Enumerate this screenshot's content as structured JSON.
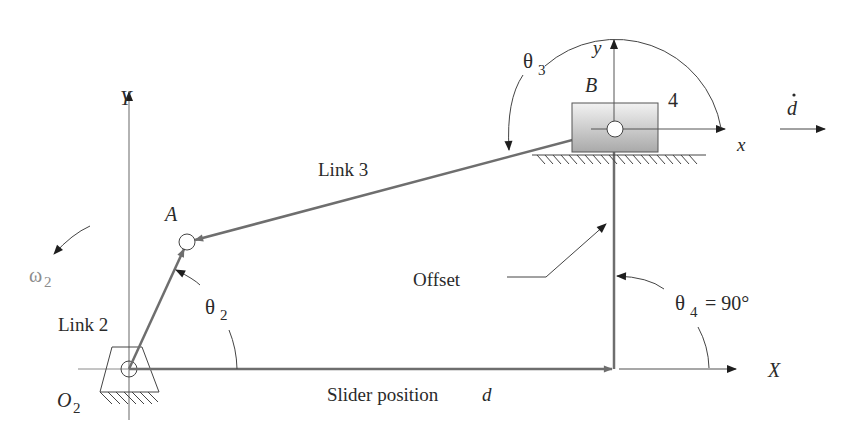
{
  "diagram": {
    "colors": {
      "link": "#6e6e6e",
      "axis": "#8a8a8a",
      "arrowhead": "#1e1e1e",
      "text": "#2a2a2a",
      "slider_fill_top": "#f2f2f2",
      "slider_fill_bottom": "#a9a9a9",
      "omega_text": "#8c8c8c"
    },
    "labels": {
      "global_y_axis": "Y",
      "global_x_axis": "X",
      "local_y_axis": "y",
      "local_x_axis": "x",
      "point_a": "A",
      "point_b": "B",
      "ground_pivot": "O",
      "ground_pivot_sub": "2",
      "link_2": "Link 2",
      "link_3": "Link 3",
      "slider_number": "4",
      "offset": "Offset",
      "slider_position": "Slider position",
      "slider_position_symbol": "d",
      "slider_velocity_symbol": "d",
      "theta2": "θ",
      "theta2_sub": "2",
      "theta3": "θ",
      "theta3_sub": "3",
      "theta4": "θ",
      "theta4_sub": "4",
      "theta4_value": "= 90°",
      "omega2": "ω",
      "omega2_sub": "2"
    },
    "points": {
      "O2": [
        129,
        369
      ],
      "A": [
        187,
        242
      ],
      "B": [
        614,
        129
      ],
      "offset_base": [
        614,
        369
      ]
    }
  }
}
